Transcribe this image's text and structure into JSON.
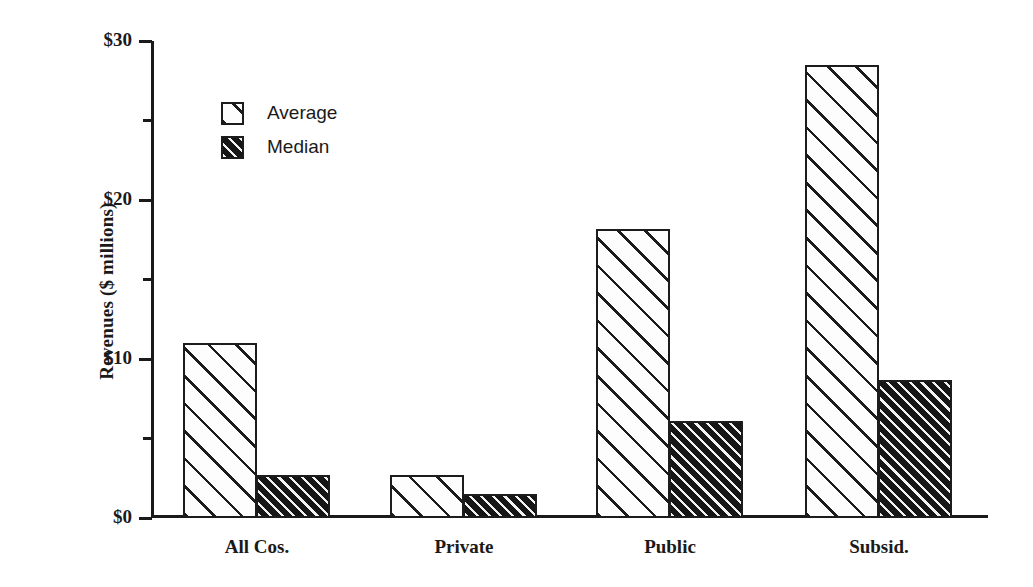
{
  "chart_data": {
    "type": "bar",
    "title": "",
    "xlabel": "",
    "ylabel": "Revenues ($ millions)",
    "categories": [
      "All Cos.",
      "Private",
      "Public",
      "Subsid."
    ],
    "series": [
      {
        "name": "Average",
        "values": [
          11.0,
          2.7,
          18.2,
          28.5
        ]
      },
      {
        "name": "Median",
        "values": [
          2.7,
          1.5,
          6.1,
          8.7
        ]
      }
    ],
    "ylim": [
      0,
      30
    ],
    "ytick_values": [
      0,
      10,
      20,
      30
    ],
    "ytick_labels": [
      "$0",
      "$10",
      "$20",
      "$30"
    ],
    "yminor_tick_values": [
      5,
      15,
      25
    ],
    "grid": false,
    "legend_position": "upper-left-inside",
    "legend_entries": [
      "Average",
      "Median"
    ],
    "bar_styles": {
      "Average": "white-with-sparse-diagonal-hatch",
      "Median": "black-with-dense-diagonal-hatch"
    }
  },
  "colors": {
    "ink": "#1a1a1a",
    "bar_outline": "#1c1c1c",
    "average_fill": "#fdfdfd",
    "median_fill": "#161616",
    "background": "#ffffff"
  }
}
